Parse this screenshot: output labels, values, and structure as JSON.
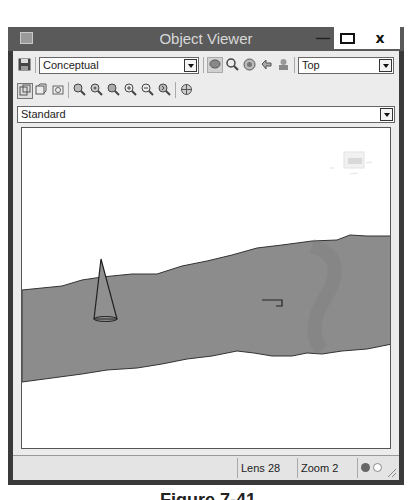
{
  "window": {
    "title": "Object Viewer",
    "controls": {
      "minimize": "—",
      "maximize": "□",
      "close": "x"
    }
  },
  "toolbar1": {
    "save_icon": "save-icon",
    "visual_style": {
      "selected": "Conceptual"
    },
    "nav_icons": [
      "pan-icon",
      "zoom-icon",
      "orbit-icon",
      "walk-icon",
      "swivel-icon"
    ],
    "view": {
      "selected": "Top"
    }
  },
  "toolbar2": {
    "icons": [
      "copy-clipboard-icon",
      "copy-view-icon",
      "camera-icon",
      "zoom-realtime-icon",
      "zoom-window-icon",
      "zoom-extents-icon",
      "zoom-in-icon",
      "zoom-out-icon",
      "zoom-previous-icon",
      "ucs-icon"
    ]
  },
  "ucs_dropdown": {
    "selected": "Standard"
  },
  "viewport": {
    "background": "#ffffff",
    "terrain_color": "#8c8c8c",
    "objects": [
      "terrain-band",
      "cone",
      "small-marker",
      "viewcube"
    ]
  },
  "status": {
    "lens": "Lens 28",
    "zoom": "Zoom 2",
    "indicator_active": "#666666",
    "indicator_inactive": "#ffffff"
  },
  "caption": "Figure 7-41"
}
